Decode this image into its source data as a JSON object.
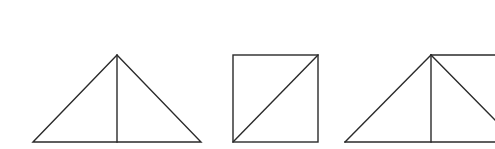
{
  "diagram": {
    "type": "geometric-figures",
    "background": "#ffffff",
    "stroke_color": "#2a2a2a",
    "figures": [
      {
        "id": "figure-1",
        "shape": "isosceles triangle split by vertical altitude",
        "apex": [
          117,
          55
        ],
        "base_left": [
          33,
          142
        ],
        "base_right": [
          201,
          142
        ],
        "altitude_foot": [
          117,
          142
        ]
      },
      {
        "id": "figure-2",
        "shape": "square split by diagonal",
        "top_left": [
          233,
          55
        ],
        "top_right": [
          318,
          55
        ],
        "bottom_right": [
          318,
          142
        ],
        "bottom_left": [
          233,
          142
        ],
        "diagonal": [
          [
            233,
            142
          ],
          [
            318,
            55
          ]
        ]
      },
      {
        "id": "figure-3",
        "shape": "triangle with altitude plus extended top edge (cropped at right)",
        "apex": [
          431,
          55
        ],
        "base_left": [
          345,
          142
        ],
        "altitude_foot": [
          431,
          142
        ],
        "top_edge_end": [
          495,
          55
        ],
        "right_diagonal_end": [
          495,
          120
        ],
        "base_end": [
          495,
          142
        ]
      }
    ]
  }
}
